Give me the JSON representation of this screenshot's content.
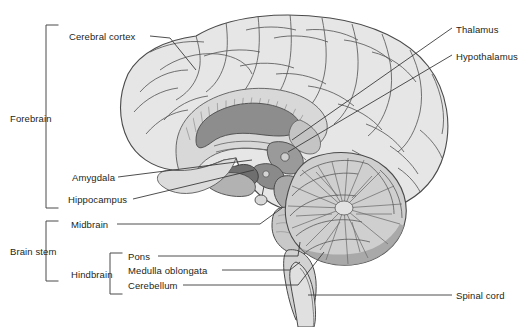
{
  "figure": {
    "width": 530,
    "height": 327,
    "background": "#ffffff",
    "ink_color": "#231f20",
    "leader_color": "#3b3b3b"
  },
  "palette": {
    "outline": "#4a4a4a",
    "cortex_fill": "#e3e3e3",
    "cortex_light": "#ededed",
    "white_matter": "#d4d4d4",
    "corpus_callosum": "#8d8d8d",
    "ventricle": "#bdbdbd",
    "thalamus": "#9a9a9a",
    "hypothalamus": "#8a8a8a",
    "amygdala": "#6f6f6f",
    "hippocampus": "#b0b0b0",
    "midbrain": "#a8a8a8",
    "pons": "#c6c6c6",
    "medulla": "#d0d0d0",
    "cerebellum_fill": "#cccccc",
    "cerebellum_cortex": "#9e9e9e",
    "spinal_cord": "#dedede"
  },
  "labels": {
    "cerebral_cortex": "Cerebral cortex",
    "forebrain": "Forebrain",
    "amygdala": "Amygdala",
    "hippocampus": "Hippocampus",
    "brain_stem": "Brain stem",
    "midbrain": "Midbrain",
    "hindbrain": "Hindbrain",
    "pons": "Pons",
    "medulla_oblongata": "Medulla oblongata",
    "cerebellum": "Cerebellum",
    "thalamus": "Thalamus",
    "hypothalamus": "Hypothalamus",
    "spinal_cord": "Spinal cord"
  },
  "label_positions": {
    "cerebral_cortex": {
      "x": 69,
      "y": 31,
      "align": "left"
    },
    "forebrain": {
      "x": 10,
      "y": 113,
      "align": "left"
    },
    "amygdala": {
      "x": 72,
      "y": 180,
      "align": "left"
    },
    "hippocampus": {
      "x": 68,
      "y": 202,
      "align": "left"
    },
    "brain_stem": {
      "x": 10,
      "y": 250,
      "align": "left"
    },
    "midbrain": {
      "x": 71,
      "y": 227,
      "align": "left"
    },
    "hindbrain": {
      "x": 71,
      "y": 273,
      "align": "left"
    },
    "pons": {
      "x": 128,
      "y": 259,
      "align": "left"
    },
    "medulla_oblongata": {
      "x": 128,
      "y": 273,
      "align": "left"
    },
    "cerebellum": {
      "x": 128,
      "y": 288,
      "align": "left"
    },
    "thalamus": {
      "x": 456,
      "y": 30,
      "align": "left"
    },
    "hypothalamus": {
      "x": 456,
      "y": 57,
      "align": "left"
    },
    "spinal_cord": {
      "x": 456,
      "y": 297,
      "align": "left"
    }
  },
  "brackets": [
    {
      "name": "forebrain-bracket",
      "x": 46,
      "top": 25,
      "bottom": 208,
      "arm": 12
    },
    {
      "name": "brainstem-bracket",
      "x": 46,
      "top": 221,
      "bottom": 281,
      "arm": 12
    },
    {
      "name": "hindbrain-bracket",
      "x": 110,
      "top": 253,
      "bottom": 294,
      "arm": 12
    }
  ],
  "leaders": [
    {
      "name": "cerebral-cortex-leader",
      "points": "150,36 168,38 196,70"
    },
    {
      "name": "amygdala-leader",
      "points": "118,177 250,160"
    },
    {
      "name": "hippocampus-leader",
      "points": "133,199 255,168"
    },
    {
      "name": "midbrain-leader",
      "points": "117,224 258,224 280,210"
    },
    {
      "name": "pons-leader",
      "points": "160,256 300,256 300,240"
    },
    {
      "name": "medulla-leader",
      "points": "220,270 288,270 300,262"
    },
    {
      "name": "cerebellum-leader",
      "points": "182,285 296,285 322,254"
    },
    {
      "name": "thalamus-leader",
      "points": "452,28 290,138"
    },
    {
      "name": "hypothalamus-leader",
      "points": "452,55 286,150"
    },
    {
      "name": "spinal-cord-leader",
      "points": "452,295 310,295"
    }
  ],
  "structures": [
    "cerebral-cortex",
    "corpus-callosum",
    "lateral-ventricle",
    "thalamus",
    "hypothalamus",
    "amygdala",
    "hippocampus",
    "midbrain",
    "pons",
    "medulla-oblongata",
    "cerebellum",
    "spinal-cord",
    "pituitary"
  ]
}
